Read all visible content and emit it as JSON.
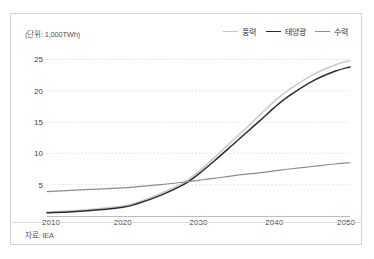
{
  "card": {
    "unit_label": "(단위: 1,000TWh)",
    "source_note": "자료: IEA"
  },
  "legend": {
    "items": [
      {
        "label": "풍력",
        "color": "#c9c9c9"
      },
      {
        "label": "태양광",
        "color": "#2b2b2b"
      },
      {
        "label": "수력",
        "color": "#8c8c8c"
      }
    ]
  },
  "chart_data": {
    "type": "line",
    "title": "",
    "subtitle": "",
    "xlabel": "",
    "ylabel": "(단위: 1,000TWh)",
    "xlim": [
      2010,
      2050
    ],
    "ylim": [
      0,
      26.5
    ],
    "yticks": [
      5,
      10,
      15,
      20,
      25
    ],
    "xticks": [
      2010,
      2020,
      2030,
      2040,
      2050
    ],
    "grid": true,
    "grid_style": "dotted-horizontal",
    "legend_position": "top-right",
    "source": "자료: IEA",
    "x": [
      2010,
      2015,
      2020,
      2022,
      2025,
      2028,
      2030,
      2032,
      2035,
      2038,
      2040,
      2042,
      2045,
      2048,
      2050
    ],
    "series": [
      {
        "name": "풍력",
        "color": "#c9c9c9",
        "values": [
          0.6,
          1.0,
          1.6,
          2.2,
          3.6,
          5.3,
          7.1,
          9.2,
          12.6,
          16.0,
          18.3,
          20.2,
          22.5,
          24.1,
          24.8
        ]
      },
      {
        "name": "태양광",
        "color": "#2b2b2b",
        "values": [
          0.5,
          0.8,
          1.4,
          2.0,
          3.3,
          5.0,
          6.7,
          8.7,
          11.9,
          15.1,
          17.3,
          19.2,
          21.5,
          23.1,
          23.8
        ]
      },
      {
        "name": "수력",
        "color": "#8c8c8c",
        "values": [
          3.9,
          4.2,
          4.5,
          4.7,
          5.0,
          5.4,
          5.7,
          6.0,
          6.5,
          6.9,
          7.2,
          7.5,
          7.9,
          8.3,
          8.5
        ]
      }
    ]
  }
}
